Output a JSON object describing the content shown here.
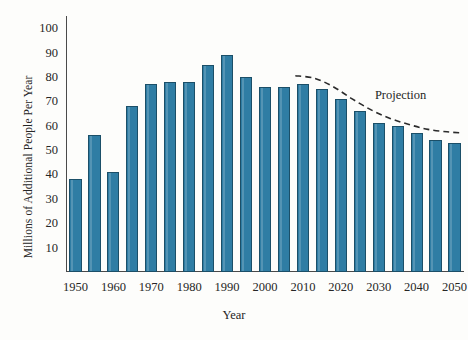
{
  "chart_data": {
    "type": "bar",
    "title": "",
    "xlabel": "Year",
    "ylabel": "Millions of Additional People Per Year",
    "categories": [
      "1950",
      "1955",
      "1960",
      "1965",
      "1970",
      "1975",
      "1980",
      "1985",
      "1990",
      "1995",
      "2000",
      "2005",
      "2010",
      "2015",
      "2020",
      "2025",
      "2030",
      "2035",
      "2040",
      "2045",
      "2050"
    ],
    "values": [
      38,
      56,
      41,
      68,
      77,
      78,
      78,
      85,
      89,
      80,
      76,
      76,
      77,
      75,
      71,
      66,
      61,
      60,
      57,
      54,
      53
    ],
    "ylim": [
      0,
      105
    ],
    "xlim": [
      1947.5,
      2052.5
    ],
    "yticks": [
      10,
      20,
      30,
      40,
      50,
      60,
      70,
      80,
      90,
      100
    ],
    "ytick_labels": [
      "10",
      "20",
      "30",
      "40",
      "50",
      "60",
      "70",
      "80",
      "90",
      "100"
    ],
    "xticks": [
      1950,
      1960,
      1970,
      1980,
      1990,
      2000,
      2010,
      2020,
      2030,
      2040,
      2050
    ],
    "xtick_labels": [
      "1950",
      "1960",
      "1970",
      "1980",
      "1990",
      "2000",
      "2010",
      "2020",
      "2030",
      "2040",
      "2050"
    ],
    "grid": false,
    "legend_position": "none",
    "bar_color": "#2f7da4",
    "bar_edge_color": "#1b4f68",
    "axis_color": "#4a4a4a",
    "annotations": [
      {
        "name": "projection",
        "label": "Projection",
        "style": "dashed-curve",
        "color": "#2b2b2b",
        "label_x": 2029,
        "label_y": 72,
        "curve_points": [
          {
            "x": 2008,
            "y": 80.5
          },
          {
            "x": 2013,
            "y": 79.5
          },
          {
            "x": 2018,
            "y": 76.0
          },
          {
            "x": 2023,
            "y": 71.0
          },
          {
            "x": 2028,
            "y": 66.5
          },
          {
            "x": 2033,
            "y": 63.0
          },
          {
            "x": 2038,
            "y": 60.5
          },
          {
            "x": 2043,
            "y": 58.5
          },
          {
            "x": 2048,
            "y": 57.5
          },
          {
            "x": 2052,
            "y": 57.0
          }
        ]
      }
    ]
  }
}
